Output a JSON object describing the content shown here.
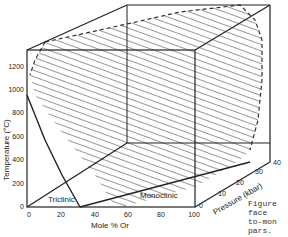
{
  "figure": {
    "type": "3D phase diagram",
    "y_axis": {
      "label": "Temperature (°C)",
      "ticks": [
        "0",
        "200",
        "400",
        "600",
        "800",
        "1000",
        "1200"
      ]
    },
    "x_axis": {
      "label": "Mole % Or",
      "ticks": [
        "0",
        "20",
        "40",
        "60",
        "80",
        "100"
      ]
    },
    "z_axis": {
      "label": "Pressure (kbar)",
      "ticks": [
        "0",
        "10",
        "20",
        "30",
        "40"
      ]
    },
    "regions": {
      "triclinic": "Triclinic",
      "monoclinic": "Monoclinic"
    },
    "caption_lines": [
      "Figure",
      "face",
      "to-mon",
      "pars.",
      "sh..."
    ]
  }
}
